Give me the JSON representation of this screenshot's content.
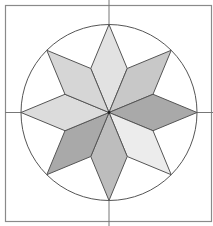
{
  "diagram": {
    "shapes": {
      "frame": "square",
      "circle": "circumscribed circle",
      "axes": "horizontal and vertical center lines",
      "star_points": 8
    },
    "colors": {
      "stroke": "#555555",
      "frame_stroke": "#8a8a8a",
      "background": "#ffffff",
      "rhombus_fills": [
        "#e2e2e2",
        "#d6d6d6",
        "#c8c8c8",
        "#bdbdbd",
        "#dcdcdc",
        "#a9a9a9",
        "#cfcfcf",
        "#ececec"
      ]
    },
    "rhombi": [
      {
        "direction": "N",
        "shade_index": 0
      },
      {
        "direction": "NE",
        "shade_index": 2
      },
      {
        "direction": "E",
        "shade_index": 5
      },
      {
        "direction": "SE",
        "shade_index": 7
      },
      {
        "direction": "S",
        "shade_index": 3
      },
      {
        "direction": "SW",
        "shade_index": 5
      },
      {
        "direction": "W",
        "shade_index": 4
      },
      {
        "direction": "NW",
        "shade_index": 1
      }
    ]
  }
}
